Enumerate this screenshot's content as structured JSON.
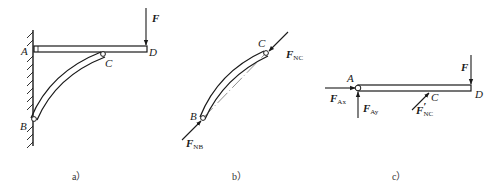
{
  "figure_a": {
    "caption": "a）",
    "labels": {
      "A": "A",
      "B": "B",
      "C": "C",
      "D": "D"
    },
    "force": {
      "symbol": "F"
    }
  },
  "figure_b": {
    "caption": "b）",
    "labels": {
      "B": "B",
      "C": "C"
    },
    "forces": {
      "at_C": {
        "symbol": "F",
        "sub": "NC"
      },
      "at_B": {
        "symbol": "F",
        "sub": "NB"
      }
    }
  },
  "figure_c": {
    "caption": "c）",
    "labels": {
      "A": "A",
      "C": "C",
      "D": "D"
    },
    "forces": {
      "Ax": {
        "symbol": "F",
        "sub": "Ax"
      },
      "Ay": {
        "symbol": "F",
        "sub": "Ay"
      },
      "F": {
        "symbol": "F"
      },
      "NC_prime": {
        "symbol": "F",
        "prime": "′",
        "sub": "NC"
      }
    }
  },
  "colors": {
    "ink": "#1a1a1a",
    "background": "#ffffff"
  }
}
